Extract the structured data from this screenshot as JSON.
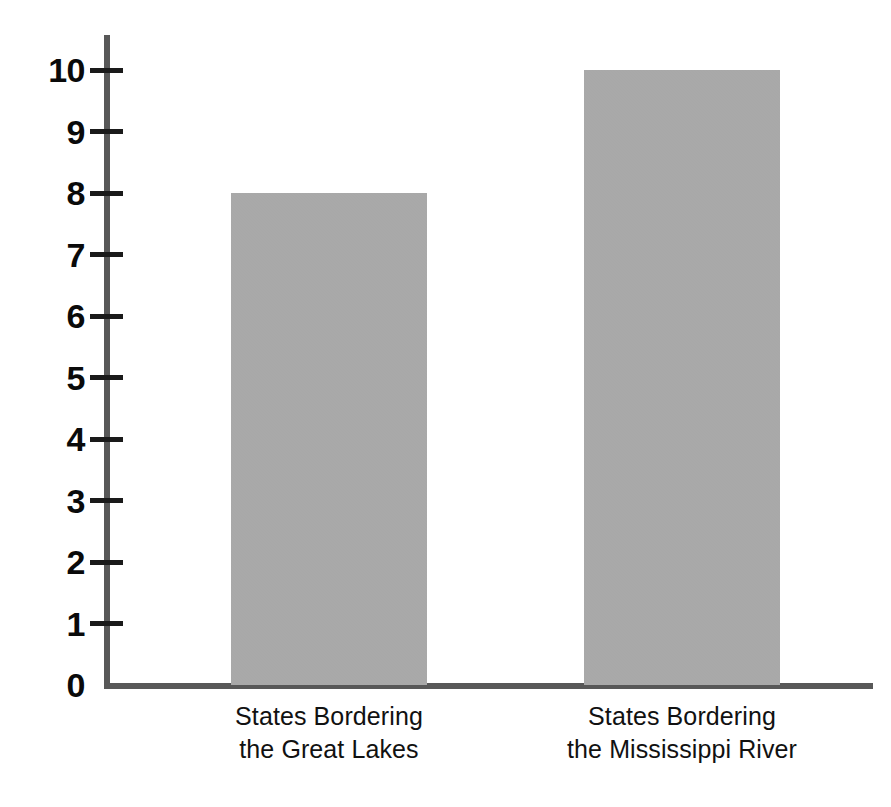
{
  "chart_data": {
    "type": "bar",
    "title": "",
    "subtitle": "",
    "xlabel": "",
    "ylabel": "",
    "categories": [
      "States Bordering the Great Lakes",
      "States Bordering the Mississippi River"
    ],
    "category_lines": [
      [
        "States Bordering",
        "the Great Lakes"
      ],
      [
        "States Bordering",
        "the Mississippi River"
      ]
    ],
    "values": [
      8,
      10
    ],
    "ylim": [
      0,
      10
    ],
    "ytick_labels": [
      "10",
      "9",
      "8",
      "7",
      "6",
      "5",
      "4",
      "3",
      "2",
      "1",
      "0"
    ],
    "ytick_values": [
      10,
      9,
      8,
      7,
      6,
      5,
      4,
      3,
      2,
      1,
      0
    ],
    "ytick_step": 1,
    "grid": false,
    "legend": false,
    "legend_position": "none",
    "annotations": [],
    "colors": {
      "bar_fill": "#a8a8a8",
      "axis_line": "#585858",
      "tick_mark": "#1a1a1a",
      "tick_label": "#0a0a0a",
      "category_label": "#111111",
      "background": "#ffffff"
    }
  },
  "bars": [
    {
      "label": "States Bordering the Great Lakes",
      "value": 8
    },
    {
      "label": "States Bordering the Mississippi River",
      "value": 10
    }
  ],
  "yticks": [
    {
      "label": "10",
      "value": 10
    },
    {
      "label": "9",
      "value": 9
    },
    {
      "label": "8",
      "value": 8
    },
    {
      "label": "7",
      "value": 7
    },
    {
      "label": "6",
      "value": 6
    },
    {
      "label": "5",
      "value": 5
    },
    {
      "label": "4",
      "value": 4
    },
    {
      "label": "3",
      "value": 3
    },
    {
      "label": "2",
      "value": 2
    },
    {
      "label": "1",
      "value": 1
    },
    {
      "label": "0",
      "value": 0
    }
  ],
  "categories": [
    {
      "line1": "States Bordering",
      "line2": "the Great Lakes"
    },
    {
      "line1": "States Bordering",
      "line2": "the Mississippi River"
    }
  ]
}
